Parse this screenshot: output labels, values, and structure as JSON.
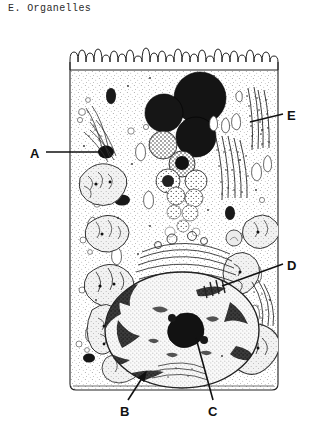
{
  "figure": {
    "title": "E. Organelles",
    "ink_color": "#1a1a1a",
    "background_color": "#ffffff"
  },
  "labels": [
    {
      "id": "A",
      "text": "A",
      "x": 34,
      "y": 158,
      "leader_to_x": 103,
      "leader_to_y": 152,
      "target": "lysosome-dark-granule"
    },
    {
      "id": "B",
      "text": "B",
      "x": 123,
      "y": 414,
      "leader_to_x": 148,
      "leader_to_y": 370,
      "target": "pigment-granule",
      "arrow": true
    },
    {
      "id": "C",
      "text": "C",
      "x": 212,
      "y": 414,
      "leader_to_x": 196,
      "leader_to_y": 336,
      "target": "nucleolus"
    },
    {
      "id": "D",
      "text": "D",
      "x": 288,
      "y": 268,
      "leader_to_x": 224,
      "leader_to_y": 288,
      "target": "rough-er-near-nucleus"
    },
    {
      "id": "E",
      "text": "E",
      "x": 288,
      "y": 118,
      "leader_to_x": 252,
      "leader_to_y": 122,
      "target": "rough-endoplasmic-reticulum"
    }
  ],
  "cell": {
    "left": 70,
    "top": 48,
    "right": 278,
    "bottom": 390,
    "microvilli_count": 34,
    "membrane_stroke": "#222222"
  },
  "structures": {
    "microvilli": "finger-like projections along apical (top) border",
    "lysosomes": "graded series of dark spheres, solid black at top fading to granular below",
    "mitochondria": "oval organelles with internal cristae, scattered left and right",
    "rough_er": "stacked membranes studded with ribosome dots",
    "golgi": "stack of flattened curved cisternae above nucleus",
    "nucleus": "large stippled oval in lower half",
    "nucleolus": "dense dark body inside nucleus"
  }
}
